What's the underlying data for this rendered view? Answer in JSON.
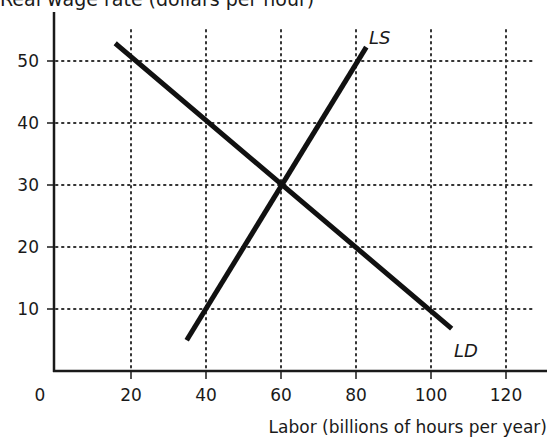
{
  "chart_data": {
    "type": "line",
    "title": "",
    "ylabel": "Real wage rate (dollars per hour)",
    "xlabel": "Labor (billions of hours per year)",
    "origin_label": "0",
    "x_ticks": [
      20,
      40,
      60,
      80,
      100,
      120
    ],
    "y_ticks": [
      10,
      20,
      30,
      40,
      50
    ],
    "xlim": [
      0,
      130
    ],
    "ylim": [
      0,
      58
    ],
    "grid": "dotted",
    "series": [
      {
        "name": "LD",
        "label": "LD",
        "points": [
          [
            16.3,
            52.6
          ],
          [
            105,
            7.1
          ]
        ]
      },
      {
        "name": "LS",
        "label": "LS",
        "points": [
          [
            35.2,
            5.3
          ],
          [
            82.4,
            51.9
          ]
        ]
      }
    ],
    "annotations": [
      {
        "text": "Equilibrium",
        "x": 60,
        "y": 30
      }
    ]
  }
}
